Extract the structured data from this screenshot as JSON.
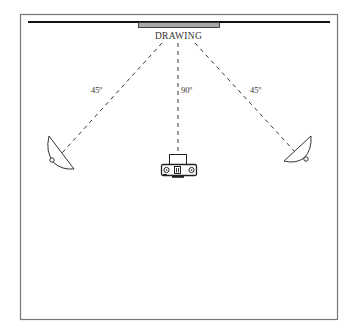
{
  "diagram": {
    "type": "lighting-setup",
    "subject_label": "DRAWING",
    "angles": {
      "left_lamp": "45º",
      "camera": "90º",
      "right_lamp": "45º"
    },
    "elements": [
      {
        "name": "wall",
        "type": "line"
      },
      {
        "name": "drawing",
        "type": "rectangle",
        "label": "DRAWING"
      },
      {
        "name": "left-lamp",
        "type": "light",
        "angle": "45º"
      },
      {
        "name": "camera",
        "type": "camera",
        "angle": "90º"
      },
      {
        "name": "right-lamp",
        "type": "light",
        "angle": "45º"
      }
    ],
    "colors": {
      "frame": "#777777",
      "wall": "#111111",
      "drawing_fill": "#a8a8a8",
      "lines": "#333333",
      "text": "#333333"
    }
  }
}
